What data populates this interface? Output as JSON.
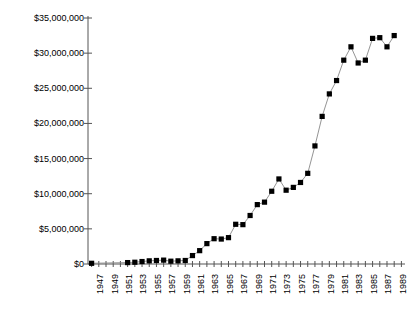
{
  "chart_data": {
    "type": "line",
    "title": "",
    "subtitle": "",
    "xlabel": "",
    "ylabel": "",
    "grid": false,
    "legend": "none",
    "marker": "filled-square",
    "line_color": "#888888",
    "marker_color": "#000000",
    "axis_color": "#555555",
    "xlim": [
      1946.5,
      1990.5
    ],
    "ylim": [
      0,
      35000000
    ],
    "y_ticks": [
      0,
      5000000,
      10000000,
      15000000,
      20000000,
      25000000,
      30000000,
      35000000
    ],
    "y_tick_labels": [
      "$0",
      "$5,000,000",
      "$10,000,000",
      "$15,000,000",
      "$20,000,000",
      "$25,000,000",
      "$30,000,000",
      "$35,000,000"
    ],
    "x_tick_labels": [
      "1947",
      "1949",
      "1951",
      "1953",
      "1955",
      "1957",
      "1959",
      "1961",
      "1963",
      "1965",
      "1967",
      "1969",
      "1971",
      "1973",
      "1975",
      "1977",
      "1979",
      "1981",
      "1983",
      "1985",
      "1987",
      "1989"
    ],
    "x_tick_years": [
      1947,
      1949,
      1951,
      1953,
      1955,
      1957,
      1959,
      1961,
      1963,
      1965,
      1967,
      1969,
      1971,
      1973,
      1975,
      1977,
      1979,
      1981,
      1983,
      1985,
      1987,
      1989
    ],
    "x_minor_years": [
      1948,
      1950,
      1952,
      1954,
      1956,
      1958,
      1960,
      1962,
      1964,
      1966,
      1968,
      1970,
      1972,
      1974,
      1976,
      1978,
      1980,
      1982,
      1984,
      1986,
      1988,
      1990
    ],
    "x": [
      1947,
      1952,
      1953,
      1954,
      1955,
      1956,
      1957,
      1958,
      1959,
      1960,
      1961,
      1962,
      1963,
      1964,
      1965,
      1966,
      1967,
      1968,
      1969,
      1970,
      1971,
      1972,
      1973,
      1974,
      1975,
      1976,
      1977,
      1978,
      1979,
      1980,
      1981,
      1982,
      1983,
      1984,
      1985,
      1986,
      1987,
      1988,
      1989
    ],
    "values": [
      100000,
      200000,
      250000,
      350000,
      450000,
      500000,
      550000,
      400000,
      450000,
      500000,
      1200000,
      1900000,
      2900000,
      3600000,
      3550000,
      3750000,
      5650000,
      5600000,
      6900000,
      8450000,
      8800000,
      10350000,
      12100000,
      10500000,
      10900000,
      11600000,
      12900000,
      16800000,
      21000000,
      24200000,
      26100000,
      29000000,
      30900000,
      28600000,
      29000000,
      32100000,
      32200000,
      30900000,
      32500000
    ],
    "series_name": ""
  }
}
